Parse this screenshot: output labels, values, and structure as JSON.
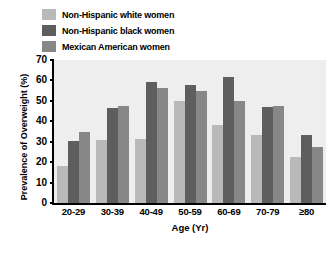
{
  "chart_data": {
    "type": "bar",
    "title": "",
    "xlabel": "Age (Yr)",
    "ylabel": "Prevalence of Overweight (%)",
    "ylim": [
      0,
      70
    ],
    "yticks": [
      0,
      10,
      20,
      30,
      40,
      50,
      60,
      70
    ],
    "grid": false,
    "legend_position": "top-left",
    "categories": [
      "20-29",
      "30-39",
      "40-49",
      "50-59",
      "60-69",
      "70-79",
      "≥80"
    ],
    "series": [
      {
        "name": "Non-Hispanic white women",
        "color": "#b9b9b9",
        "values": [
          18,
          31,
          31.5,
          50,
          38,
          33.5,
          22.5
        ]
      },
      {
        "name": "Non-Hispanic black women",
        "color": "#5e5e5e",
        "values": [
          30.5,
          46.5,
          59,
          58,
          61.5,
          47,
          33.5
        ]
      },
      {
        "name": "Mexican American women",
        "color": "#878787",
        "values": [
          35,
          47.5,
          56.5,
          55,
          50,
          47.5,
          27.5
        ]
      }
    ]
  },
  "colors": {
    "plot_background": "#eeeeee",
    "axis": "#000000",
    "page_background": "#ffffff"
  }
}
